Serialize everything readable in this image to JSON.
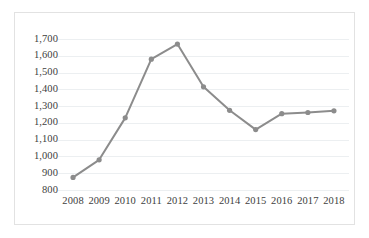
{
  "chart_data": {
    "type": "line",
    "title": "",
    "xlabel": "",
    "ylabel": "",
    "categories": [
      "2008",
      "2009",
      "2010",
      "2011",
      "2012",
      "2013",
      "2014",
      "2015",
      "2016",
      "2017",
      "2018"
    ],
    "values": [
      875,
      980,
      1230,
      1580,
      1670,
      1415,
      1275,
      1160,
      1255,
      1262,
      1272
    ],
    "series": [
      {
        "name": "",
        "values": [
          875,
          980,
          1230,
          1580,
          1670,
          1415,
          1275,
          1160,
          1255,
          1262,
          1272
        ]
      }
    ],
    "ylim": [
      800,
      1700
    ],
    "ytick_values": [
      800,
      900,
      1000,
      1100,
      1200,
      1300,
      1400,
      1500,
      1600,
      1700
    ],
    "ytick_labels": [
      "800",
      "900",
      "1,000",
      "1,100",
      "1,200",
      "1,300",
      "1,400",
      "1,500",
      "1,600",
      "1,700"
    ],
    "grid": true,
    "grid_axis": "y",
    "legend": false,
    "legend_position": "none",
    "line_color": "#8c8c8c",
    "marker_color": "#8c8c8c",
    "grid_color": "#eceff1",
    "border_color": "#e2e2e2",
    "tick_label_color": "#404040",
    "background_color": "#ffffff"
  }
}
